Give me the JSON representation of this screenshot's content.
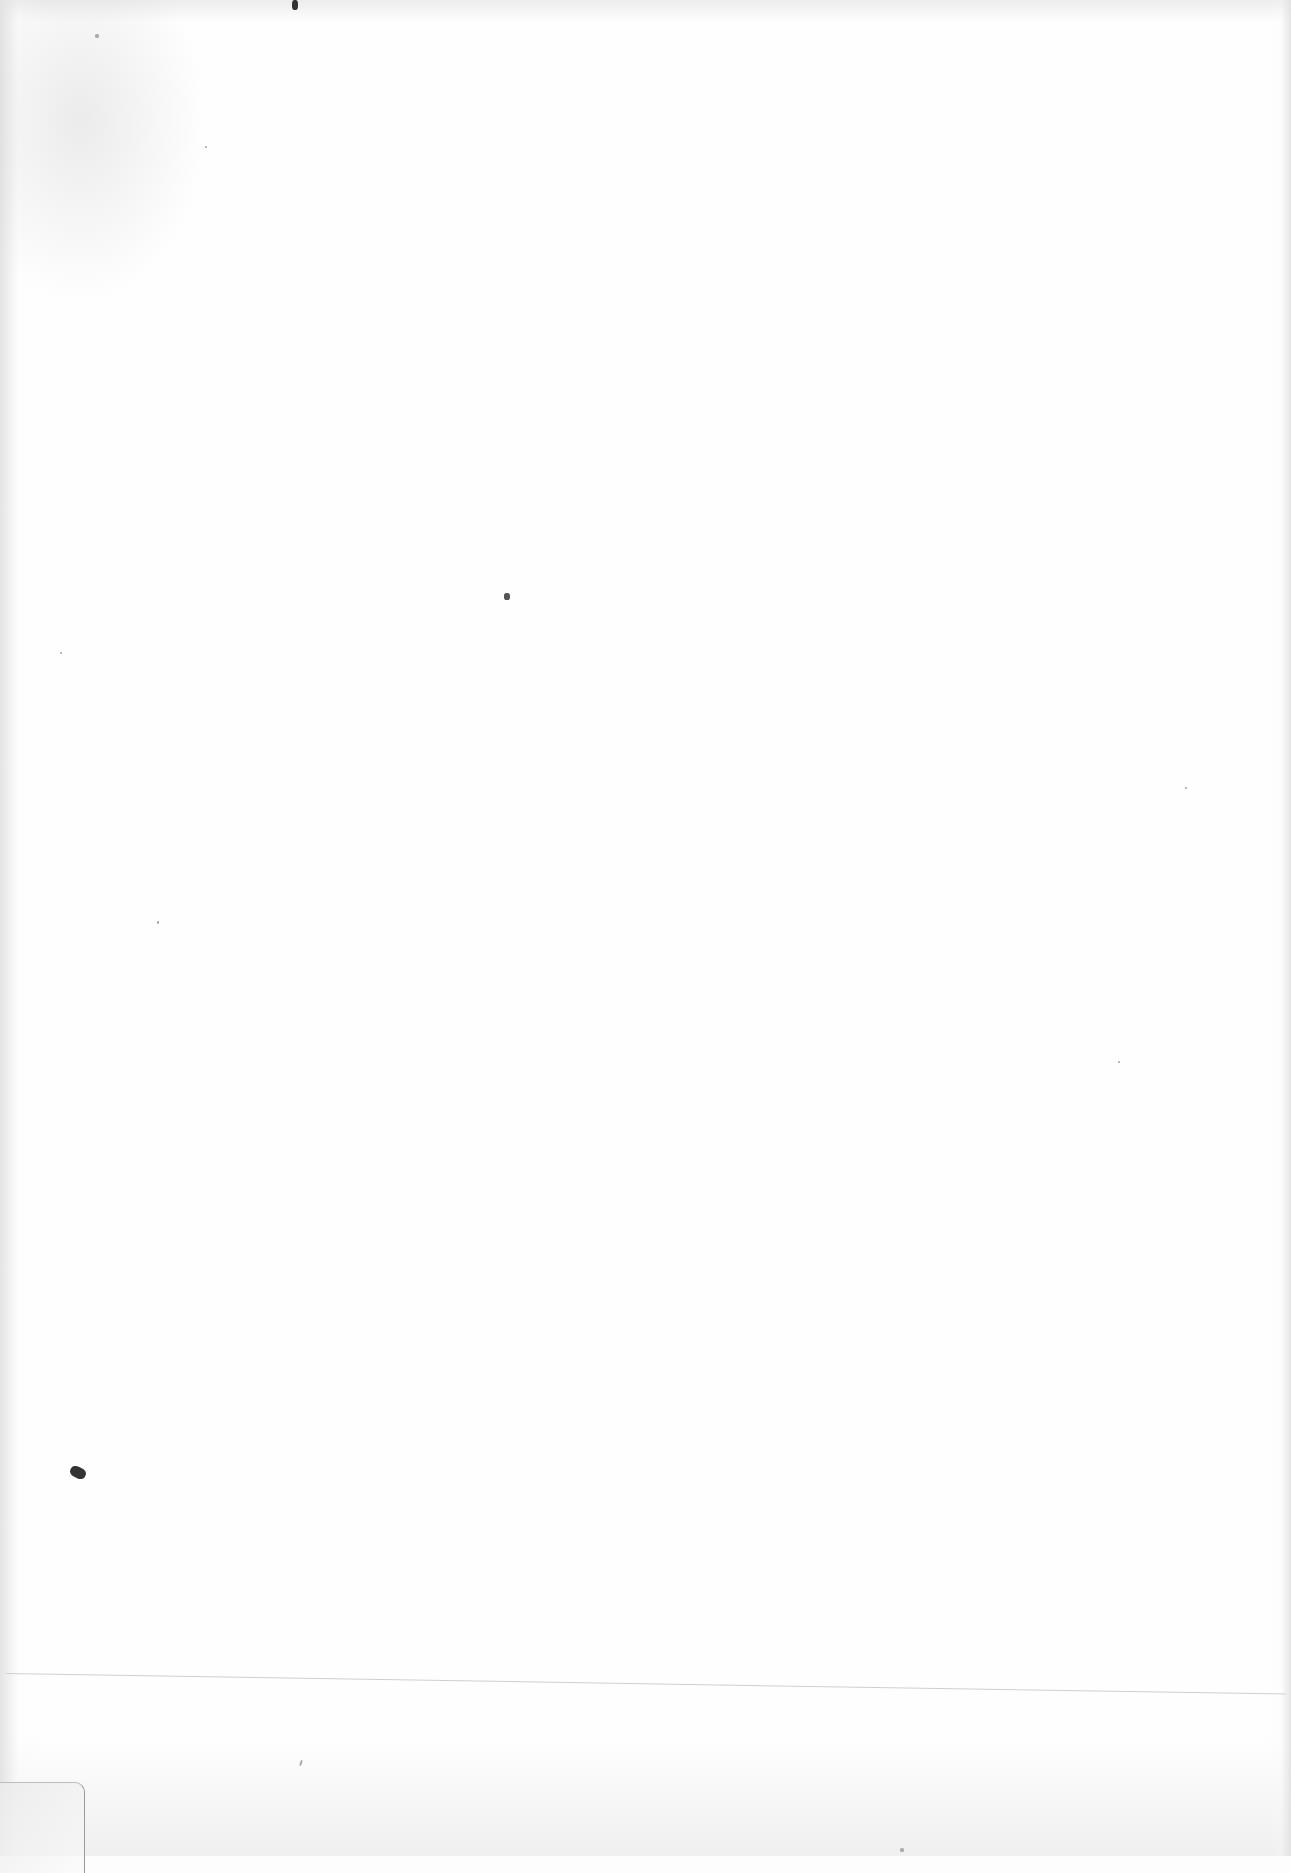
{
  "document": {
    "type": "blank-scanned-page",
    "text_content": "",
    "elements": {
      "horizontal_rule": true,
      "corner_tab": true
    }
  }
}
